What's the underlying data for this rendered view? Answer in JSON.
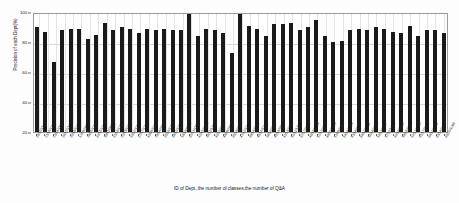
{
  "chart_data": {
    "type": "bar",
    "title": "",
    "xlabel": "ID of Dept.,the number of classes,the number of Q&A",
    "ylabel": "Precision of each Dept(%)",
    "ylim": [
      20,
      100
    ],
    "yticks": [
      20,
      40,
      60,
      80,
      100
    ],
    "grid": true,
    "legend": null,
    "bar_color": "#1a1a1a",
    "categories": [
      "28/10/1103",
      "21/16/1206",
      "23/14/1180",
      "26/12/1136",
      "20/18/1022",
      "17/09/0818",
      "24/20/1255",
      "30/15/1307",
      "19/11/0964",
      "31/18/1281",
      "22/13/1092",
      "33/12/1348",
      "27/17/1209",
      "43/09/1009",
      "29/14/0926",
      "25/16/1227",
      "34/10/1316",
      "18/19/0852",
      "32/13/1154",
      "42/15/1038",
      "36/11/1265",
      "40/20/1298",
      "44/09/0879",
      "35/18/1193",
      "47/12/1342",
      "39/14/1021",
      "46/16/1246",
      "38/10/1107",
      "45/19/0938",
      "41/13/1288",
      "50/11/1215",
      "37/17/1352",
      "48/15/0994",
      "52/12/1173",
      "49/20/1329",
      "51/09/1062",
      "54/16/1234",
      "53/14/1305",
      "56/10/0911",
      "55/18/1268",
      "58/13/1147",
      "57/11/1321",
      "60/19/1056",
      "59/15/1228",
      "62/12/1290",
      "61/17/0983",
      "64/10/1186",
      "63/14/1312",
      "65/20/1099"
    ],
    "values": [
      90,
      87,
      67,
      88,
      89,
      89,
      82,
      85,
      93,
      88,
      90,
      89,
      86,
      89,
      88,
      89,
      88,
      88,
      100,
      84,
      89,
      88,
      86,
      73,
      100,
      91,
      89,
      84,
      92,
      92,
      93,
      88,
      90,
      95,
      84,
      80,
      81,
      88,
      89,
      88,
      90,
      89,
      87,
      86,
      91,
      84,
      88,
      88,
      86
    ]
  }
}
